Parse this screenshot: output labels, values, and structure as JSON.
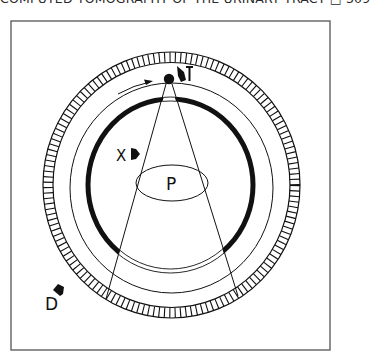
{
  "header": {
    "running_title": "COMPUTED TOMOGRAPHY OF THE URINARY TRACT",
    "box_glyph": "□",
    "page_number": "309"
  },
  "figure": {
    "labels": {
      "tube": "T",
      "detector": "D",
      "collimator": "X",
      "patient": "P"
    },
    "colors": {
      "ink": "#111111",
      "frame": "#555555",
      "background": "#ffffff"
    }
  }
}
